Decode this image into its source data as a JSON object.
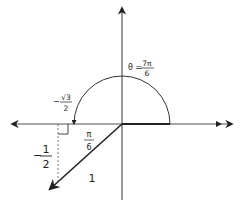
{
  "diagram": {
    "angle_label": {
      "prefix": "θ =",
      "numerator": "7π",
      "denominator": "6"
    },
    "x_coordinate_label": {
      "sign": "−",
      "numerator": "√3",
      "denominator": "2"
    },
    "y_coordinate_label": {
      "sign": "−",
      "numerator": "1",
      "denominator": "2"
    },
    "reference_angle_label": {
      "numerator": "π",
      "denominator": "6"
    },
    "radius_label": "1",
    "angle_radians_fraction_of_pi": 1.1667,
    "reference_angle_fraction_of_pi": 0.1667,
    "colors": {
      "line": "#222222",
      "axis": "#555555",
      "background": "#ffffff"
    }
  }
}
